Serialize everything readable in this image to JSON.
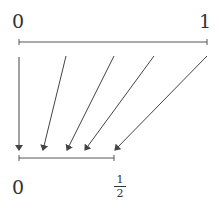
{
  "diagram": {
    "type": "interval-map",
    "top_interval": {
      "left_label": "0",
      "right_label": "1"
    },
    "bottom_interval": {
      "left_label": "0",
      "right_label": {
        "numerator": "1",
        "denominator": "2"
      }
    },
    "arrows": [
      {
        "from": [
          19,
          57
        ],
        "to": [
          19,
          150
        ]
      },
      {
        "from": [
          66,
          56
        ],
        "to": [
          43,
          150
        ]
      },
      {
        "from": [
          114,
          56
        ],
        "to": [
          67,
          150
        ]
      },
      {
        "from": [
          154,
          56
        ],
        "to": [
          85,
          150
        ]
      },
      {
        "from": [
          207,
          56
        ],
        "to": [
          115,
          150
        ]
      }
    ],
    "color": "#444444"
  }
}
